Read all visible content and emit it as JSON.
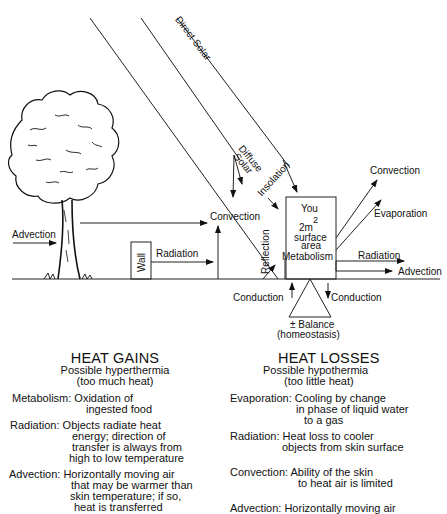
{
  "diagram": {
    "labels": {
      "direct_solar": "Direct Solar",
      "diffuse": "Diffuse",
      "solar": "Solar",
      "insolation": "Insolation",
      "convection_top_right": "Convection",
      "evaporation": "Evaporation",
      "convection_middle": "Convection",
      "advection_left": "Advection",
      "wall": "Wall",
      "radiation_left": "Radiation",
      "reflection": "Reflection",
      "you": "You",
      "area_value": "2m",
      "area_exp": "2",
      "surface": "surface",
      "area": "area",
      "metabolism": "Metabolism",
      "radiation_right": "Radiation",
      "advection_right": "Advection",
      "conduction_left": "Conduction",
      "conduction_right": "Conduction",
      "balance_symbol": "±",
      "balance": "Balance",
      "homeostasis": "(homeostasis)"
    }
  },
  "heat_gains": {
    "title": "HEAT GAINS",
    "subtitle": "Possible hyperthermia",
    "subtitle2": "(too much heat)",
    "entries": [
      {
        "lines": [
          "Metabolism: Oxidation of",
          "ingested food"
        ]
      },
      {
        "lines": [
          "Radiation: Objects radiate heat",
          "energy; direction of",
          "transfer is always from",
          "high to low temperature"
        ]
      },
      {
        "lines": [
          "Advection: Horizontally moving air",
          "that may be warmer than",
          "skin temperature; if so,",
          "heat is transferred"
        ]
      }
    ]
  },
  "heat_losses": {
    "title": "HEAT LOSSES",
    "subtitle": "Possible hypothermia",
    "subtitle2": "(too little heat)",
    "entries": [
      {
        "lines": [
          "Evaporation: Cooling by change",
          "in phase of liquid water",
          "to a gas"
        ]
      },
      {
        "lines": [
          "Radiation: Heat loss to cooler",
          "objects from skin surface"
        ]
      },
      {
        "lines": [
          "Convection: Ability of the skin",
          "to heat air is limited"
        ]
      },
      {
        "lines": [
          "Advection: Horizontally moving air"
        ]
      }
    ]
  }
}
